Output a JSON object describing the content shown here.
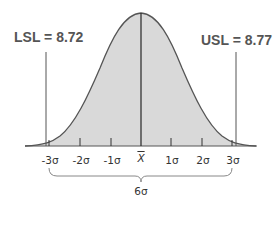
{
  "labels": {
    "lsl": "LSL = 8.72",
    "usl": "USL = 8.77",
    "spread": "6σ"
  },
  "axis": {
    "ticks": [
      {
        "label": "-3σ",
        "x": 49
      },
      {
        "label": "-2σ",
        "x": 80
      },
      {
        "label": "-1σ",
        "x": 111
      },
      {
        "label": "X",
        "x": 141,
        "overline": true
      },
      {
        "label": "1σ",
        "x": 171
      },
      {
        "label": "2σ",
        "x": 202
      },
      {
        "label": "3σ",
        "x": 232
      }
    ]
  },
  "colors": {
    "fill": "#d9d9d9",
    "stroke": "#555555",
    "text": "#555555"
  }
}
